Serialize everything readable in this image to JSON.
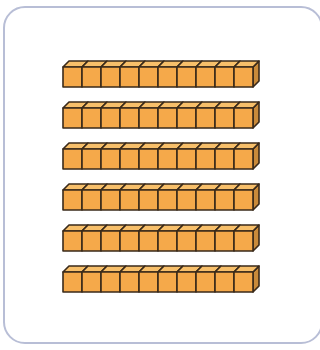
{
  "figure": {
    "rod_count": 6,
    "cubes_per_rod": 10,
    "total_units": 60
  },
  "colors": {
    "cube_front": "#f5a94a",
    "cube_top": "#f7bf6a",
    "cube_side": "#c98a3a",
    "outline": "#3a2a1a",
    "frame_border": "#b8bed6",
    "background": "#ffffff"
  },
  "layout": {
    "rod_x": 63,
    "rod_y_positions": [
      67,
      108,
      149,
      190,
      231,
      272
    ],
    "cube_width": 19,
    "cube_height": 20,
    "depth_dx": 6,
    "depth_dy": 6
  }
}
